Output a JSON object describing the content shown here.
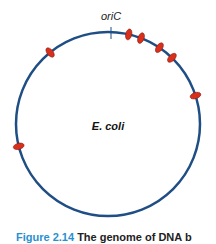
{
  "diagram": {
    "organism_label": "E. coli",
    "origin_label": "oriC",
    "colors": {
      "chromosome": "#1f4e85",
      "marker_fill": "#d9301c",
      "marker_stroke": "#8a1a10",
      "caption_fig": "#2a8fd0"
    },
    "circle": {
      "cx": 108,
      "cy": 124,
      "r": 92
    },
    "origin_angle_deg": 0,
    "markers_angle_deg": [
      13,
      21,
      34,
      44,
      72,
      321,
      256
    ]
  },
  "caption": {
    "figure_label": "Figure 2.14",
    "text": "The genome of DNA b"
  }
}
